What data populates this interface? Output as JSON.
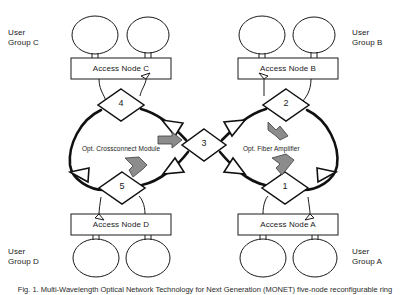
{
  "figure": {
    "caption": "Fig. 1. Multi-Wavelength Optical Network Technology for Next Generation (MONET) five-node reconfigurable ring",
    "colors": {
      "line": "#1a1a1a",
      "ring": "#111111",
      "fill": "#ffffff",
      "gray_arrow": "#8c8c8c",
      "gray_arrow_stroke": "#3d3d3d",
      "text": "#1a1a1a"
    }
  },
  "user_groups": [
    {
      "id": "C",
      "line1": "User",
      "line2": "Group C",
      "x": 8,
      "y": 28
    },
    {
      "id": "B",
      "line1": "User",
      "line2": "Group B",
      "x": 352,
      "y": 28
    },
    {
      "id": "D",
      "line1": "User",
      "line2": "Group D",
      "x": 8,
      "y": 247
    },
    {
      "id": "A",
      "line1": "User",
      "line2": "Group A",
      "x": 352,
      "y": 247
    }
  ],
  "access_nodes": [
    {
      "id": "C",
      "label": "Access Node C",
      "x": 71,
      "y": 58,
      "w": 100,
      "h": 21
    },
    {
      "id": "B",
      "label": "Access Node B",
      "x": 238,
      "y": 58,
      "w": 100,
      "h": 21
    },
    {
      "id": "D",
      "label": "Access Node D",
      "x": 71,
      "y": 214,
      "w": 100,
      "h": 21
    },
    {
      "id": "A",
      "label": "Access Node A",
      "x": 238,
      "y": 214,
      "w": 100,
      "h": 21
    }
  ],
  "switch_nodes": [
    {
      "label": "4",
      "cx": 121,
      "cy": 105,
      "rx": 23,
      "ry": 16
    },
    {
      "label": "2",
      "cx": 286,
      "cy": 105,
      "rx": 23,
      "ry": 16
    },
    {
      "label": "3",
      "cx": 204,
      "cy": 145,
      "rx": 22,
      "ry": 16
    },
    {
      "label": "5",
      "cx": 122,
      "cy": 188,
      "rx": 23,
      "ry": 16
    },
    {
      "label": "1",
      "cx": 285,
      "cy": 188,
      "rx": 23,
      "ry": 16
    }
  ],
  "annotations": [
    {
      "name": "opt-crossconnect-module",
      "text": "Opt. Crossconnect Module",
      "x": 82,
      "y": 144
    },
    {
      "name": "opt-fiber-amplifier",
      "text": "Opt. Fiber Amplifier",
      "x": 243,
      "y": 144
    }
  ],
  "user_terminals": [
    {
      "group": "C",
      "cx": 95,
      "cy": 35,
      "rx": 23,
      "ry": 19
    },
    {
      "group": "C",
      "cx": 148,
      "cy": 35,
      "rx": 21,
      "ry": 18
    },
    {
      "group": "B",
      "cx": 262,
      "cy": 35,
      "rx": 23,
      "ry": 19
    },
    {
      "group": "B",
      "cx": 314,
      "cy": 35,
      "rx": 21,
      "ry": 18
    },
    {
      "group": "D",
      "cx": 96,
      "cy": 258,
      "rx": 23,
      "ry": 19
    },
    {
      "group": "D",
      "cx": 148,
      "cy": 258,
      "rx": 22,
      "ry": 19
    },
    {
      "group": "A",
      "cx": 263,
      "cy": 258,
      "rx": 23,
      "ry": 19
    },
    {
      "group": "A",
      "cx": 315,
      "cy": 258,
      "rx": 22,
      "ry": 19
    }
  ]
}
